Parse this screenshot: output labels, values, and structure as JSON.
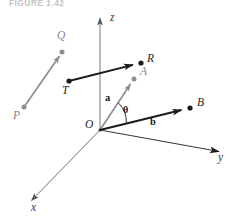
{
  "figure": {
    "caption": "FIGURE 1.42",
    "background_color": "#ffffff"
  },
  "colors": {
    "axis": "#8a8a90",
    "axis_label": "#37373a",
    "gray_vector": "#8e8e95",
    "black_vector": "#1b1b1e",
    "gray_label": "#828288",
    "black_label": "#242427"
  },
  "axes": [
    {
      "name": "z",
      "label": "z",
      "from": [
        100,
        130
      ],
      "to": [
        100,
        16
      ]
    },
    {
      "name": "y",
      "label": "y",
      "from": [
        100,
        130
      ],
      "to": [
        221,
        152
      ]
    },
    {
      "name": "x",
      "label": "x",
      "from": [
        100,
        130
      ],
      "to": [
        29,
        203
      ]
    }
  ],
  "axis_labels": [
    {
      "name": "z-axis-label",
      "text": "z",
      "x": 110,
      "y": 19
    },
    {
      "name": "y-axis-label",
      "text": "y",
      "x": 219,
      "y": 158
    },
    {
      "name": "x-axis-label",
      "text": "x",
      "x": 31,
      "y": 207
    }
  ],
  "points": [
    {
      "name": "P",
      "label": "P",
      "x": 24,
      "y": 107,
      "label_x": 14,
      "label_y": 110,
      "style": "gray"
    },
    {
      "name": "Q",
      "label": "Q",
      "x": 62,
      "y": 52,
      "label_x": 58,
      "label_y": 31,
      "style": "gray"
    },
    {
      "name": "T",
      "label": "T",
      "x": 69,
      "y": 81,
      "label_x": 63,
      "label_y": 85,
      "style": "black"
    },
    {
      "name": "R",
      "label": "R",
      "x": 141,
      "y": 63,
      "label_x": 148,
      "label_y": 53,
      "style": "black"
    },
    {
      "name": "A",
      "label": "A",
      "x": 134,
      "y": 79,
      "label_x": 141,
      "label_y": 70,
      "style": "gray"
    },
    {
      "name": "B",
      "label": "B",
      "x": 190,
      "y": 108,
      "label_x": 198,
      "label_y": 100,
      "style": "black"
    },
    {
      "name": "O",
      "label": "O",
      "x": 100,
      "y": 130,
      "label_x": 86,
      "label_y": 118,
      "style": "origin"
    }
  ],
  "vectors": [
    {
      "name": "vector-PQ",
      "label": "",
      "from": [
        24,
        107
      ],
      "to": [
        62,
        52
      ],
      "color": "gray",
      "start_dot": true,
      "end_dot": true
    },
    {
      "name": "vector-TR",
      "label": "",
      "from": [
        69,
        81
      ],
      "to": [
        141,
        63
      ],
      "color": "black",
      "start_dot": true,
      "end_dot": true
    },
    {
      "name": "vector-a",
      "label": "a",
      "label_x": 105,
      "label_y": 95,
      "from": [
        100,
        130
      ],
      "to": [
        134,
        79
      ],
      "color": "gray",
      "start_dot": false,
      "end_dot": true
    },
    {
      "name": "vector-b",
      "label": "b",
      "label_x": 150,
      "label_y": 119,
      "from": [
        100,
        130
      ],
      "to": [
        190,
        108
      ],
      "color": "black",
      "start_dot": false,
      "end_dot": true
    }
  ],
  "angle": {
    "name": "theta-angle",
    "symbol": "θ",
    "label_x": 124,
    "label_y": 107,
    "vertex": [
      100,
      130
    ],
    "radius": 27
  }
}
